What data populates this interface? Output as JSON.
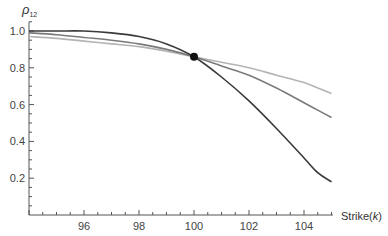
{
  "chart_data": {
    "type": "line",
    "title": "",
    "xlabel": "Strike(k)",
    "ylabel": "ρ12",
    "xlim": [
      93.8,
      105.2
    ],
    "ylim": [
      0.0,
      1.06
    ],
    "x_ticks": [
      96,
      98,
      100,
      102,
      104
    ],
    "y_ticks": [
      0.2,
      0.4,
      0.6,
      0.8,
      1.0
    ],
    "x_tick_labels": [
      "96",
      "98",
      "100",
      "102",
      "104"
    ],
    "y_tick_labels": [
      "0.2",
      "0.4",
      "0.6",
      "0.8",
      "1.0"
    ],
    "grid": false,
    "legend": null,
    "x": [
      94,
      95,
      96,
      97,
      98,
      99,
      100,
      101,
      102,
      103,
      104,
      104.5,
      105
    ],
    "series": [
      {
        "name": "dark",
        "color": "#3a3a3a",
        "values": [
          1.0,
          1.0,
          1.0,
          0.99,
          0.97,
          0.93,
          0.86,
          0.75,
          0.62,
          0.47,
          0.31,
          0.23,
          0.18
        ]
      },
      {
        "name": "medium",
        "color": "#7a7a7a",
        "values": [
          0.99,
          0.98,
          0.965,
          0.95,
          0.93,
          0.9,
          0.86,
          0.81,
          0.76,
          0.69,
          0.61,
          0.57,
          0.53
        ]
      },
      {
        "name": "light",
        "color": "#b4b4b4",
        "values": [
          0.97,
          0.96,
          0.945,
          0.93,
          0.915,
          0.89,
          0.86,
          0.83,
          0.8,
          0.76,
          0.72,
          0.69,
          0.66
        ]
      }
    ],
    "annotations": [
      {
        "type": "point",
        "x": 100,
        "y": 0.86,
        "label": "intersection"
      }
    ]
  }
}
